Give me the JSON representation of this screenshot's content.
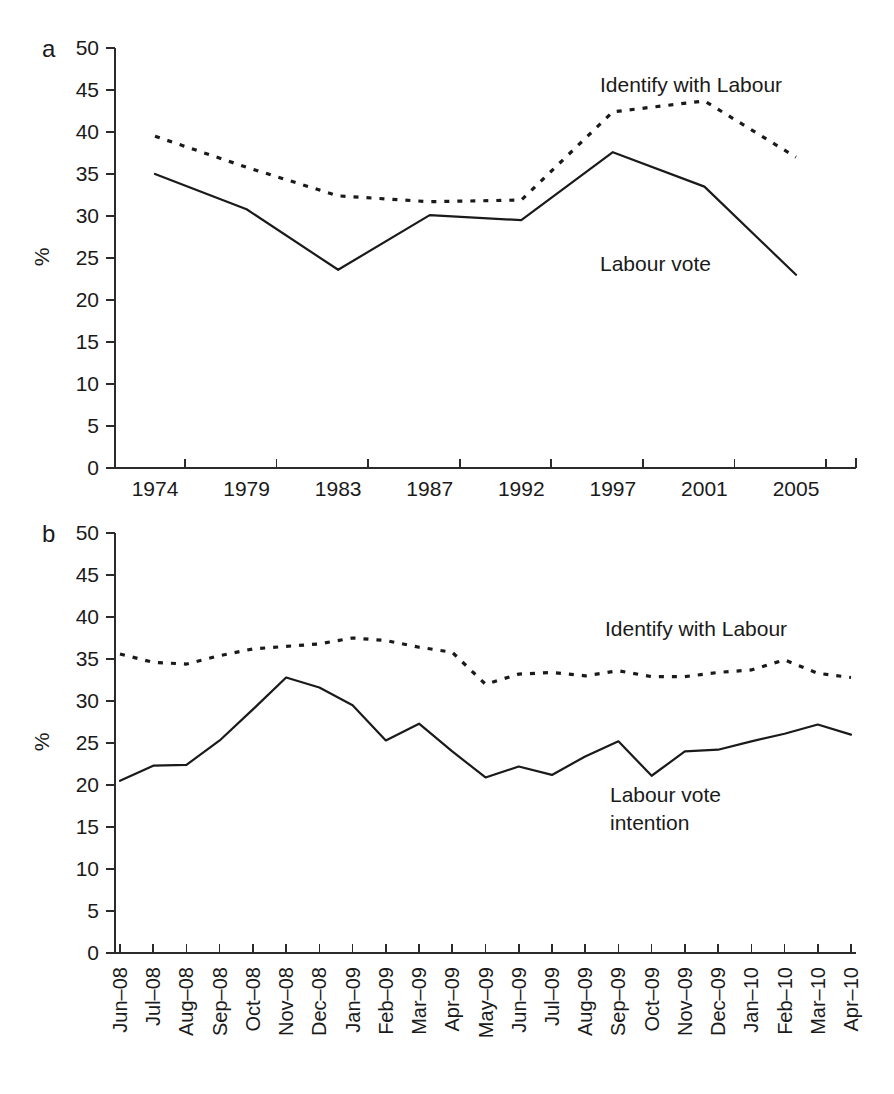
{
  "figure": {
    "background": "#ffffff",
    "ink_color": "#1a1a1a"
  },
  "panels": [
    {
      "letter": "a",
      "ylabel": "%",
      "annotation_identify": "Identify with Labour",
      "annotation_vote": "Labour vote"
    },
    {
      "letter": "b",
      "ylabel": "%",
      "annotation_identify": "Identify with Labour",
      "annotation_vote_line1": "Labour vote",
      "annotation_vote_line2": "intention"
    }
  ],
  "chart_data": [
    {
      "type": "line",
      "panel": "a",
      "title": "",
      "xlabel": "",
      "ylabel": "%",
      "ylim": [
        0,
        50
      ],
      "ytick_step": 5,
      "yticks": [
        0,
        5,
        10,
        15,
        20,
        25,
        30,
        35,
        40,
        45,
        50
      ],
      "grid": false,
      "legend_position": "inline-annotations",
      "categories": [
        "1974",
        "1979",
        "1983",
        "1987",
        "1992",
        "1997",
        "2001",
        "2005"
      ],
      "series": [
        {
          "name": "Identify with Labour",
          "style": "dotted",
          "values": [
            39.5,
            35.8,
            32.4,
            31.7,
            31.9,
            42.4,
            43.7,
            37.0
          ]
        },
        {
          "name": "Labour vote",
          "style": "solid",
          "values": [
            35.0,
            30.8,
            23.6,
            30.1,
            29.5,
            37.6,
            33.5,
            23.0
          ]
        }
      ]
    },
    {
      "type": "line",
      "panel": "b",
      "title": "",
      "xlabel": "",
      "ylabel": "%",
      "ylim": [
        0,
        50
      ],
      "ytick_step": 5,
      "yticks": [
        0,
        5,
        10,
        15,
        20,
        25,
        30,
        35,
        40,
        45,
        50
      ],
      "grid": false,
      "legend_position": "inline-annotations",
      "categories": [
        "Jun–08",
        "Jul–08",
        "Aug–08",
        "Sep–08",
        "Oct–08",
        "Nov–08",
        "Dec–08",
        "Jan–09",
        "Feb–09",
        "Mar–09",
        "Apr–09",
        "May–09",
        "Jun–09",
        "Jul–09",
        "Aug–09",
        "Sep–09",
        "Oct–09",
        "Nov–09",
        "Dec–09",
        "Jan–10",
        "Feb–10",
        "Mar–10",
        "Apr–10"
      ],
      "series": [
        {
          "name": "Identify with Labour",
          "style": "dotted",
          "values": [
            35.6,
            34.6,
            34.4,
            35.4,
            36.2,
            36.5,
            36.8,
            37.5,
            37.2,
            36.4,
            35.8,
            32.0,
            33.2,
            33.4,
            33.0,
            33.6,
            32.9,
            32.9,
            33.4,
            33.7,
            34.9,
            33.3,
            32.8
          ]
        },
        {
          "name": "Labour vote intention",
          "style": "solid",
          "values": [
            20.5,
            22.3,
            22.4,
            25.3,
            29.0,
            32.8,
            31.6,
            29.5,
            25.3,
            27.3,
            24.0,
            20.9,
            22.2,
            21.2,
            23.4,
            25.2,
            21.1,
            24.0,
            24.2,
            25.2,
            26.1,
            27.2,
            26.0
          ]
        }
      ]
    }
  ]
}
